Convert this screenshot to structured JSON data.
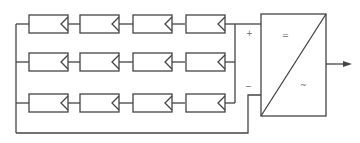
{
  "diagram": {
    "type": "pv-array-to-inverter",
    "array": {
      "rows": 3,
      "modules_per_row": 4
    },
    "inverter": {
      "label_dc": "=",
      "label_ac": "~"
    },
    "terminals": {
      "positive": "+",
      "negative": "−"
    },
    "colors": {
      "line": "#444444",
      "label": "#666666",
      "background": "#ffffff"
    }
  }
}
